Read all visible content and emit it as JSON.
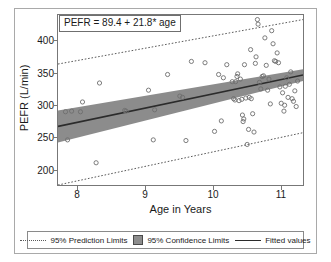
{
  "chart_data": {
    "type": "scatter",
    "title": "",
    "annotation": "PEFR = 89.4 + 21.8* age",
    "xlabel": "Age in Years",
    "ylabel": "PEFR (L/min)",
    "xlim": [
      7.72,
      11.32
    ],
    "ylim": [
      168,
      428
    ],
    "xticks": [
      8,
      9,
      10,
      11
    ],
    "xticklabels": [
      "8",
      "9",
      "10",
      "11"
    ],
    "yticks": [
      200,
      250,
      300,
      350,
      400
    ],
    "yticklabels": [
      "200",
      "250",
      "300",
      "350",
      "400"
    ],
    "grid": false,
    "legend_position": "bottom",
    "regression": {
      "intercept": 89.4,
      "slope": 21.8,
      "equation": "PEFR = 89.4 + 21.8* age"
    },
    "series": [
      {
        "name": "Observations",
        "marker": "open-circle",
        "color": "#6e6e6e",
        "x": [
          7.83,
          7.86,
          7.92,
          8.05,
          8.08,
          8.28,
          8.33,
          8.7,
          8.72,
          9.05,
          9.12,
          9.14,
          9.33,
          9.51,
          9.55,
          9.6,
          9.68,
          9.88,
          10.02,
          10.08,
          10.12,
          10.15,
          10.2,
          10.28,
          10.3,
          10.32,
          10.33,
          10.35,
          10.36,
          10.38,
          10.4,
          10.42,
          10.43,
          10.44,
          10.45,
          10.46,
          10.48,
          10.5,
          10.52,
          10.53,
          10.55,
          10.56,
          10.58,
          10.6,
          10.62,
          10.63,
          10.65,
          10.66,
          10.68,
          10.7,
          10.72,
          10.74,
          10.76,
          10.78,
          10.8,
          10.82,
          10.84,
          10.86,
          10.88,
          10.9,
          10.92,
          10.94,
          10.96,
          10.98,
          11.0,
          11.02,
          11.04,
          11.05,
          11.06,
          11.08,
          11.1,
          11.12,
          11.14,
          11.16,
          11.18,
          11.2,
          11.22,
          11.24
        ],
        "y": [
          280,
          237,
          281,
          280,
          295,
          202,
          324,
          282,
          281,
          313,
          237,
          283,
          337,
          304,
          302,
          236,
          357,
          355,
          250,
          337,
          266,
          332,
          352,
          326,
          300,
          298,
          326,
          334,
          338,
          297,
          330,
          299,
          275,
          265,
          269,
          352,
          301,
          230,
          253,
          302,
          375,
          300,
          277,
          249,
          354,
          364,
          421,
          414,
          325,
          315,
          334,
          335,
          393,
          351,
          313,
          330,
          292,
          404,
          384,
          358,
          357,
          370,
          355,
          318,
          293,
          309,
          281,
          290,
          319,
          332,
          302,
          322,
          341,
          300,
          296,
          312,
          288,
          327
        ]
      }
    ],
    "fitted_line": {
      "name": "Fitted values",
      "color": "#2b2b2b",
      "style": "solid",
      "x": [
        7.72,
        11.32
      ],
      "y": [
        257.7,
        336.2
      ]
    },
    "confidence_limits": {
      "name": "95% Confidence Limits",
      "level": 0.95,
      "fill": "#8c8c8c",
      "x": [
        7.72,
        11.32
      ],
      "upper": [
        282.0,
        345.0
      ],
      "lower": [
        233.0,
        327.0
      ]
    },
    "prediction_limits": {
      "name": "95% Prediction Limits",
      "level": 0.95,
      "color": "#5a5a5a",
      "style": "dotted",
      "x": [
        7.72,
        11.32
      ],
      "upper": [
        353.0,
        421.0
      ],
      "lower": [
        168.0,
        248.0
      ]
    }
  },
  "legend": {
    "items": [
      {
        "label": "95% Prediction Limits",
        "key": "dotted-line"
      },
      {
        "label": "95% Confidence Limits",
        "key": "gray-swatch"
      },
      {
        "label": "Fitted values",
        "key": "solid-line"
      }
    ]
  }
}
